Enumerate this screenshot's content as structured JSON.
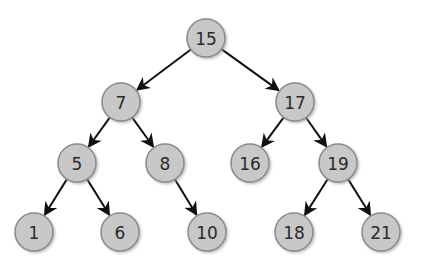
{
  "diagram": {
    "type": "binary-search-tree",
    "nodes": [
      {
        "id": "n15",
        "label": "15",
        "x": 206,
        "y": 38
      },
      {
        "id": "n7",
        "label": "7",
        "x": 121,
        "y": 102
      },
      {
        "id": "n17",
        "label": "17",
        "x": 295,
        "y": 102
      },
      {
        "id": "n5",
        "label": "5",
        "x": 77,
        "y": 163
      },
      {
        "id": "n8",
        "label": "8",
        "x": 165,
        "y": 163
      },
      {
        "id": "n16",
        "label": "16",
        "x": 250,
        "y": 163
      },
      {
        "id": "n19",
        "label": "19",
        "x": 338,
        "y": 163
      },
      {
        "id": "n1",
        "label": "1",
        "x": 34,
        "y": 232
      },
      {
        "id": "n6",
        "label": "6",
        "x": 120,
        "y": 232
      },
      {
        "id": "n10",
        "label": "10",
        "x": 207,
        "y": 232
      },
      {
        "id": "n18",
        "label": "18",
        "x": 294,
        "y": 232
      },
      {
        "id": "n21",
        "label": "21",
        "x": 381,
        "y": 232
      }
    ],
    "edges": [
      [
        "n15",
        "n7"
      ],
      [
        "n15",
        "n17"
      ],
      [
        "n7",
        "n5"
      ],
      [
        "n7",
        "n8"
      ],
      [
        "n17",
        "n16"
      ],
      [
        "n17",
        "n19"
      ],
      [
        "n5",
        "n1"
      ],
      [
        "n5",
        "n6"
      ],
      [
        "n8",
        "n10"
      ],
      [
        "n19",
        "n18"
      ],
      [
        "n19",
        "n21"
      ]
    ],
    "node_radius": 19,
    "colors": {
      "node_fill": "#c8c8c8",
      "node_stroke": "#8a8a8a",
      "edge": "#111111",
      "text": "#2a2a2a"
    }
  }
}
